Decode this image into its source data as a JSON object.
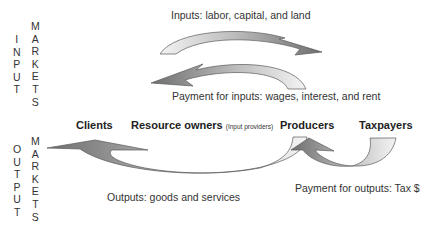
{
  "side_labels": {
    "input": {
      "col1": [
        "I",
        "N",
        "P",
        "U",
        "T"
      ],
      "col2": [
        "M",
        "A",
        "R",
        "K",
        "E",
        "T",
        "S"
      ]
    },
    "output": {
      "col1": [
        "O",
        "U",
        "T",
        "P",
        "U",
        "T"
      ],
      "col2": [
        "M",
        "A",
        "R",
        "K",
        "E",
        "T",
        "S"
      ]
    }
  },
  "flows": {
    "inputs_label": "Inputs: labor, capital, and land",
    "payment_inputs_label": "Payment for inputs:  wages, interest, and rent",
    "outputs_label": "Outputs: goods and services",
    "payment_outputs_label": "Payment for outputs: Tax $"
  },
  "actors": {
    "clients": "Clients",
    "resource_owners": "Resource owners",
    "resource_owners_note": "(Input providers)",
    "producers": "Producers",
    "taxpayers": "Taxpayers"
  },
  "colors": {
    "arrow_dark": "#7a7a7a",
    "arrow_light": "#f2f2f2",
    "arrow_stroke": "#555555"
  }
}
